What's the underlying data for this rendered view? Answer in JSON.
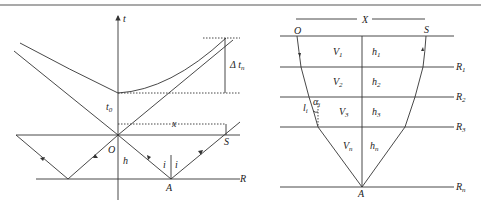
{
  "left_panel": {
    "axis_label": "t",
    "delta_label": "Δ t",
    "delta_sub": "n",
    "t0_label": "t",
    "t0_sub": "0",
    "x_label": "x",
    "origin_label": "O",
    "source_label": "S",
    "depth_label": "h",
    "incidence_left": "i",
    "incidence_right": "i",
    "reflection_point": "A",
    "reflector_label": "R"
  },
  "right_panel": {
    "offset_label": "X",
    "origin_label": "O",
    "source_label": "S",
    "reflection_point": "A",
    "layers": [
      {
        "velocity": "V",
        "vsub": "1",
        "thickness": "h",
        "hsub": "1",
        "reflector": "R",
        "rsub": "1"
      },
      {
        "velocity": "V",
        "vsub": "2",
        "thickness": "h",
        "hsub": "2",
        "reflector": "R",
        "rsub": "2"
      },
      {
        "velocity": "V",
        "vsub": "3",
        "thickness": "h",
        "hsub": "3",
        "reflector": "R",
        "rsub": "3"
      },
      {
        "velocity": "V",
        "vsub": "n",
        "thickness": "h",
        "hsub": "n",
        "reflector": "R",
        "rsub": "n"
      }
    ],
    "path_length_label": "l",
    "path_length_sub": "i",
    "angle_label": "α",
    "angle_sub": "i"
  },
  "colors": {
    "line": "#333333",
    "background": "#ffffff"
  }
}
